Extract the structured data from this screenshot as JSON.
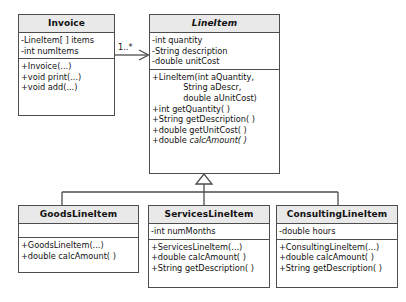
{
  "diagram": {
    "type": "uml-class-diagram",
    "colors": {
      "header_fill": "#e9e9e9",
      "body_fill": "#ffffff",
      "line": "#4d4d4d",
      "text": "#111111"
    }
  },
  "classes": {
    "invoice": {
      "name": "Invoice",
      "abstract": false,
      "attributes": [
        "-LineItem[ ] items",
        "-int numItems"
      ],
      "operations": [
        "+Invoice(...)",
        "+void print(...)",
        "+void add(...)"
      ]
    },
    "lineitem": {
      "name": "LineItem",
      "abstract": true,
      "attributes": [
        "-int quantity",
        "-String description",
        "-double unitCost"
      ],
      "operations": [
        "+LineItem(int aQuantity,",
        "            String aDescr,",
        "            double aUnitCost)",
        "+int getQuantity( )",
        "+String getDescription( )",
        "+double getUnitCost( )"
      ],
      "abstract_operation_prefix": "+double ",
      "abstract_operation_name": "calcAmount( )"
    },
    "goods": {
      "name": "GoodsLineItem",
      "abstract": false,
      "attributes": [],
      "operations": [
        "+GoodsLineItem(...)",
        "+double calcAmount( )"
      ]
    },
    "services": {
      "name": "ServicesLineItem",
      "abstract": false,
      "attributes": [
        "-int numMonths"
      ],
      "operations": [
        "+ServicesLineItem(...)",
        "+double calcAmount( )",
        "+String getDescription( )"
      ]
    },
    "consulting": {
      "name": "ConsultingLineItem",
      "abstract": false,
      "attributes": [
        "-double hours"
      ],
      "operations": [
        "+ConsultingLineItem(...)",
        "+double calcAmount( )",
        "+String getDescription( )"
      ]
    }
  },
  "relations": {
    "association": {
      "from": "Invoice",
      "to": "LineItem",
      "multiplicity": "1..*",
      "arrow": "open"
    },
    "generalization": {
      "parent": "LineItem",
      "children": [
        "GoodsLineItem",
        "ServicesLineItem",
        "ConsultingLineItem"
      ],
      "arrow": "hollow-triangle"
    }
  }
}
